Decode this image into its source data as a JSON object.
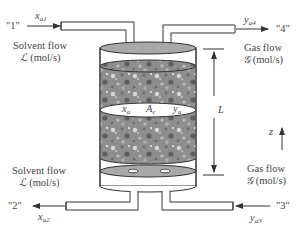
{
  "diagram": {
    "type": "packed absorption column schematic",
    "colors": {
      "packing": "#8e8e8e",
      "tray": "#a8a8a8",
      "outline": "#333333",
      "arrow": "#333333",
      "text": "#444444"
    },
    "top_left": {
      "stream_id": "\"1\"",
      "var": "x",
      "var_sub": "a1",
      "flow_label": "Solvent flow",
      "flow_symbol": "ℒ",
      "flow_units": "(mol/s)"
    },
    "top_right": {
      "stream_id": "\"4\"",
      "var": "y",
      "var_sub": "a4",
      "flow_label": "Gas flow",
      "flow_symbol": "𝒢",
      "flow_units": "(mol/s)"
    },
    "bottom_left": {
      "stream_id": "\"2\"",
      "var": "x",
      "var_sub": "a2",
      "flow_label": "Solvent flow",
      "flow_symbol": "ℒ",
      "flow_units": "(mol/s)"
    },
    "bottom_right": {
      "stream_id": "\"3\"",
      "var": "y",
      "var_sub": "a3",
      "flow_label": "Gas flow",
      "flow_symbol": "𝒢",
      "flow_units": "(mol/s)"
    },
    "section": {
      "liquid_var": "x",
      "liquid_sub": "a",
      "area_var": "A",
      "area_sub": "c",
      "gas_var": "y",
      "gas_sub": "a"
    },
    "height_label": "L",
    "axis_label": "z"
  }
}
